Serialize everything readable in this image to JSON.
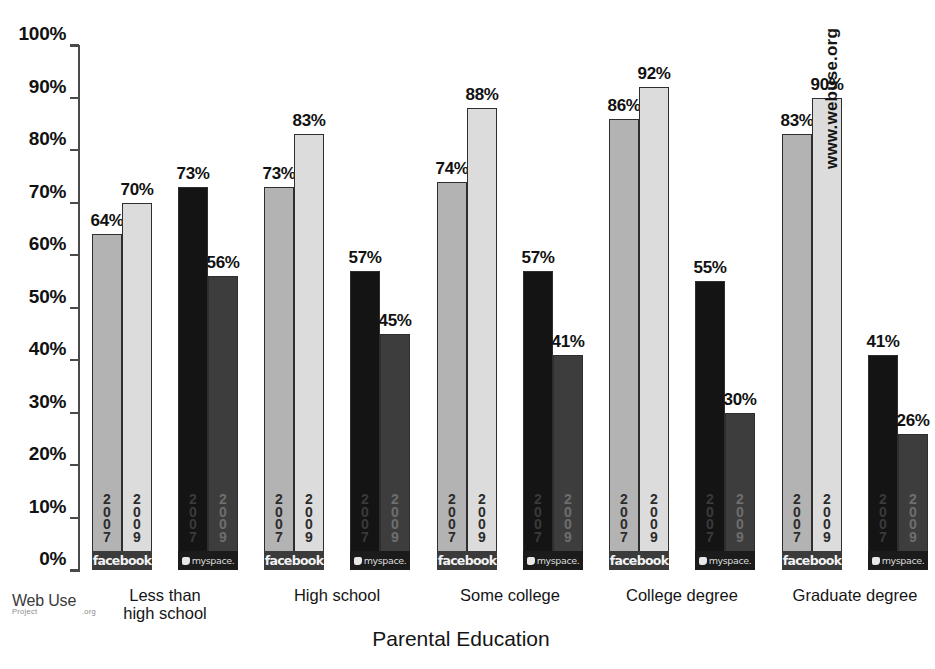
{
  "chart_data": {
    "type": "bar",
    "title": "",
    "xlabel": "Parental Education",
    "ylabel": "",
    "ylim": [
      0,
      100
    ],
    "ytick_labels": [
      "100%",
      "90%",
      "80%",
      "70%",
      "60%",
      "50%",
      "40%",
      "30%",
      "20%",
      "10%",
      "0%"
    ],
    "ytick_values": [
      100,
      90,
      80,
      70,
      60,
      50,
      40,
      30,
      20,
      10,
      0
    ],
    "grid": false,
    "legend_position": "in-bar",
    "categories": [
      "Less than\nhigh school",
      "High school",
      "Some college",
      "College degree",
      "Graduate degree"
    ],
    "series": [
      {
        "name": "facebook 2007",
        "network": "facebook",
        "year": "2007",
        "values": [
          64,
          73,
          74,
          86,
          83
        ],
        "color": "#b3b3b3"
      },
      {
        "name": "facebook 2009",
        "network": "facebook",
        "year": "2009",
        "values": [
          70,
          83,
          88,
          92,
          90
        ],
        "color": "#dcdcdc"
      },
      {
        "name": "myspace 2007",
        "network": "myspace",
        "year": "2007",
        "values": [
          73,
          57,
          57,
          55,
          41
        ],
        "color": "#141414"
      },
      {
        "name": "myspace 2009",
        "network": "myspace",
        "year": "2009",
        "values": [
          56,
          45,
          41,
          30,
          26
        ],
        "color": "#3d3d3d"
      }
    ],
    "value_labels": [
      "64%",
      "70%",
      "73%",
      "56%",
      "73%",
      "83%",
      "57%",
      "45%",
      "74%",
      "88%",
      "57%",
      "41%",
      "86%",
      "92%",
      "55%",
      "30%",
      "83%",
      "90%",
      "41%",
      "26%"
    ],
    "annotations": [
      "www.webuse.org"
    ]
  },
  "brands": {
    "facebook_label": "facebook",
    "myspace_label": "myspace."
  },
  "years": {
    "y2007": "2\n0\n0\n7",
    "y2009": "2\n0\n0\n9"
  },
  "axis": {
    "x_title": "Parental Education"
  },
  "watermark": {
    "site": "www.webuse.org"
  },
  "logo": {
    "line1": "Web Use",
    "project": "Project",
    "org": ".org"
  }
}
